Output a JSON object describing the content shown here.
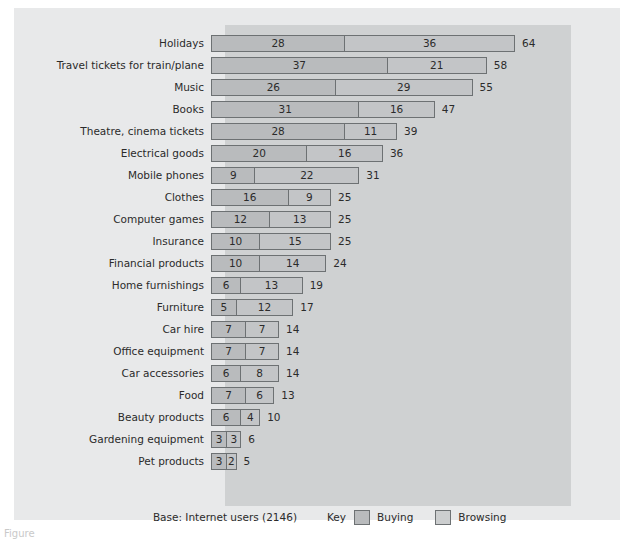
{
  "chart_data": {
    "type": "bar",
    "orientation": "horizontal",
    "stacked": true,
    "title": "",
    "xlabel": "",
    "ylabel": "",
    "grid": false,
    "legend_position": "bottom-right",
    "unit_hint": "percent of Internet users",
    "x_scale_px_per_unit": 4.72,
    "categories": [
      "Holidays",
      "Travel tickets for train/plane",
      "Music",
      "Books",
      "Theatre, cinema tickets",
      "Electrical goods",
      "Mobile phones",
      "Clothes",
      "Computer games",
      "Insurance",
      "Financial products",
      "Home furnishings",
      "Furniture",
      "Car hire",
      "Office equipment",
      "Car accessories",
      "Food",
      "Beauty products",
      "Gardening equipment",
      "Pet products"
    ],
    "series": [
      {
        "name": "Buying",
        "color": "#b9bbbd",
        "values": [
          28,
          37,
          26,
          31,
          28,
          20,
          9,
          16,
          12,
          10,
          10,
          6,
          5,
          7,
          7,
          6,
          7,
          6,
          3,
          3
        ]
      },
      {
        "name": "Browsing",
        "color": "#c3c5c7",
        "values": [
          36,
          21,
          29,
          16,
          11,
          16,
          22,
          9,
          13,
          15,
          14,
          13,
          12,
          7,
          7,
          8,
          6,
          4,
          3,
          2
        ]
      }
    ],
    "totals": [
      64,
      58,
      55,
      47,
      39,
      36,
      31,
      25,
      25,
      25,
      24,
      19,
      17,
      14,
      14,
      14,
      13,
      10,
      6,
      5
    ],
    "xlim": [
      0,
      64
    ]
  },
  "rows": [
    {
      "label": "Holidays",
      "buying": 28,
      "browsing": 36,
      "total": 64
    },
    {
      "label": "Travel tickets for train/plane",
      "buying": 37,
      "browsing": 21,
      "total": 58
    },
    {
      "label": "Music",
      "buying": 26,
      "browsing": 29,
      "total": 55
    },
    {
      "label": "Books",
      "buying": 31,
      "browsing": 16,
      "total": 47
    },
    {
      "label": "Theatre, cinema tickets",
      "buying": 28,
      "browsing": 11,
      "total": 39
    },
    {
      "label": "Electrical goods",
      "buying": 20,
      "browsing": 16,
      "total": 36
    },
    {
      "label": "Mobile phones",
      "buying": 9,
      "browsing": 22,
      "total": 31
    },
    {
      "label": "Clothes",
      "buying": 16,
      "browsing": 9,
      "total": 25
    },
    {
      "label": "Computer games",
      "buying": 12,
      "browsing": 13,
      "total": 25
    },
    {
      "label": "Insurance",
      "buying": 10,
      "browsing": 15,
      "total": 25
    },
    {
      "label": "Financial products",
      "buying": 10,
      "browsing": 14,
      "total": 24
    },
    {
      "label": "Home furnishings",
      "buying": 6,
      "browsing": 13,
      "total": 19
    },
    {
      "label": "Furniture",
      "buying": 5,
      "browsing": 12,
      "total": 17
    },
    {
      "label": "Car hire",
      "buying": 7,
      "browsing": 7,
      "total": 14
    },
    {
      "label": "Office equipment",
      "buying": 7,
      "browsing": 7,
      "total": 14
    },
    {
      "label": "Car accessories",
      "buying": 6,
      "browsing": 8,
      "total": 14
    },
    {
      "label": "Food",
      "buying": 7,
      "browsing": 6,
      "total": 13
    },
    {
      "label": "Beauty products",
      "buying": 6,
      "browsing": 4,
      "total": 10
    },
    {
      "label": "Gardening equipment",
      "buying": 3,
      "browsing": 3,
      "total": 6
    },
    {
      "label": "Pet products",
      "buying": 3,
      "browsing": 2,
      "total": 5
    }
  ],
  "footer": {
    "base_note": "Base: Internet users  (2146)",
    "key_label": "Key",
    "legend": [
      {
        "name": "Buying",
        "color": "#b9bbbd"
      },
      {
        "name": "Browsing",
        "color": "#cccecf"
      }
    ]
  },
  "caption": {
    "text": "Figure"
  },
  "colors": {
    "outer_panel": "#e8e9ea",
    "plot_band": "#cfd1d2",
    "bar_border": "#6d7173",
    "text": "#2b2b2b",
    "buying": "#b9bbbd",
    "browsing": "#c3c5c7"
  }
}
